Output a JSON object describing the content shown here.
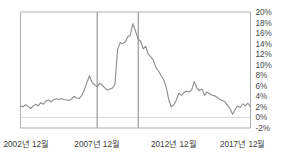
{
  "chart_data": {
    "type": "line",
    "title": "",
    "subtitle": "",
    "xlabel": "",
    "ylabel": "",
    "grid": false,
    "legend": null,
    "legend_position": "none",
    "line_color": "#8c8c8c",
    "axis_color": "#b0b0b0",
    "zero_line_color": "#d9d9d9",
    "vline_color": "#9a9a9a",
    "background_color": "#ffffff",
    "ylim": [
      -2,
      20
    ],
    "ytick_labels": [
      "20%",
      "18%",
      "16%",
      "14%",
      "12%",
      "10%",
      "8%",
      "6%",
      "4%",
      "2%",
      "0%",
      "-2%"
    ],
    "ytick_values": [
      20,
      18,
      16,
      14,
      12,
      10,
      8,
      6,
      4,
      2,
      0,
      -2
    ],
    "xtick_labels": [
      "2002년 12월",
      "2007년 12월",
      "2012년 12월",
      "2017년 12월"
    ],
    "xtick_values": [
      2002.92,
      2007.92,
      2012.92,
      2017.92
    ],
    "xlim": [
      2002.92,
      2017.92
    ],
    "annotations": [
      {
        "name": "vertical-marker-1",
        "x": 2007.92,
        "label": ""
      },
      {
        "name": "vertical-marker-2",
        "x": 2010.6,
        "label": ""
      }
    ],
    "series": [
      {
        "name": "rate",
        "x": [
          2002.92,
          2003.08,
          2003.25,
          2003.42,
          2003.58,
          2003.75,
          2003.92,
          2004.08,
          2004.25,
          2004.42,
          2004.58,
          2004.75,
          2004.92,
          2005.08,
          2005.25,
          2005.42,
          2005.58,
          2005.75,
          2005.92,
          2006.08,
          2006.25,
          2006.42,
          2006.58,
          2006.75,
          2006.92,
          2007.08,
          2007.25,
          2007.42,
          2007.58,
          2007.75,
          2007.92,
          2008.08,
          2008.25,
          2008.42,
          2008.58,
          2008.75,
          2008.92,
          2009.08,
          2009.25,
          2009.42,
          2009.58,
          2009.75,
          2009.92,
          2010.08,
          2010.25,
          2010.42,
          2010.58,
          2010.75,
          2010.92,
          2011.08,
          2011.25,
          2011.42,
          2011.58,
          2011.75,
          2011.92,
          2012.08,
          2012.25,
          2012.42,
          2012.58,
          2012.75,
          2012.92,
          2013.08,
          2013.25,
          2013.42,
          2013.58,
          2013.75,
          2013.92,
          2014.08,
          2014.25,
          2014.42,
          2014.58,
          2014.75,
          2014.92,
          2015.08,
          2015.25,
          2015.42,
          2015.58,
          2015.75,
          2015.92,
          2016.08,
          2016.25,
          2016.42,
          2016.58,
          2016.75,
          2016.92,
          2017.08,
          2017.25,
          2017.42,
          2017.58,
          2017.75,
          2017.92
        ],
        "values": [
          2.2,
          2.0,
          2.4,
          2.1,
          1.7,
          2.2,
          2.5,
          2.2,
          2.8,
          2.5,
          3.1,
          3.3,
          2.9,
          3.4,
          3.5,
          3.4,
          3.6,
          3.4,
          3.3,
          3.2,
          3.5,
          4.0,
          3.7,
          3.6,
          4.2,
          5.2,
          6.6,
          7.9,
          6.7,
          6.2,
          5.8,
          6.5,
          6.1,
          5.6,
          5.2,
          5.4,
          5.6,
          6.3,
          12.9,
          14.2,
          14.0,
          14.3,
          15.3,
          15.6,
          17.8,
          16.4,
          14.9,
          14.5,
          13.0,
          13.5,
          12.0,
          11.5,
          10.9,
          9.5,
          8.8,
          8.0,
          7.2,
          5.8,
          3.5,
          2.0,
          2.4,
          3.3,
          4.6,
          4.2,
          4.7,
          5.0,
          4.8,
          5.2,
          6.8,
          5.6,
          5.1,
          5.4,
          4.2,
          4.8,
          4.5,
          4.2,
          4.1,
          3.8,
          3.4,
          3.2,
          3.0,
          2.3,
          1.7,
          0.6,
          1.5,
          2.2,
          1.9,
          2.6,
          2.2,
          2.7,
          2.0
        ]
      }
    ]
  }
}
